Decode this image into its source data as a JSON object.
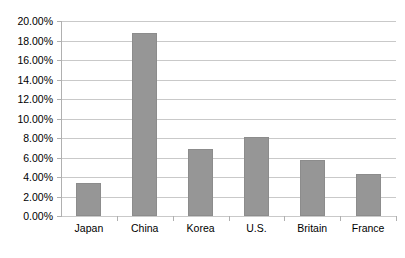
{
  "chart_data": {
    "type": "bar",
    "title": "",
    "subtitle": "",
    "xlabel": "",
    "ylabel": "",
    "categories": [
      "Japan",
      "China",
      "Korea",
      "U.S.",
      "Britain",
      "France"
    ],
    "values": [
      3.4,
      18.8,
      6.9,
      8.1,
      5.7,
      4.3
    ],
    "ylim": [
      0,
      20
    ],
    "ytick_step": 2,
    "ytick_labels": [
      "0.00%",
      "2.00%",
      "4.00%",
      "6.00%",
      "8.00%",
      "10.00%",
      "12.00%",
      "14.00%",
      "16.00%",
      "18.00%",
      "20.00%"
    ],
    "ytick_values": [
      0,
      2,
      4,
      6,
      8,
      10,
      12,
      14,
      16,
      18,
      20
    ],
    "grid": true,
    "grid_axis": "y",
    "legend": false,
    "legend_position": "none",
    "value_format": "percent",
    "bar_color": "#969696",
    "bar_border_color": "#8c8c8c",
    "gridline_color": "#c9c9c9",
    "axis_color": "#b0b0b0",
    "plot_background": "#ffffff"
  },
  "caption": {
    "text": ""
  }
}
